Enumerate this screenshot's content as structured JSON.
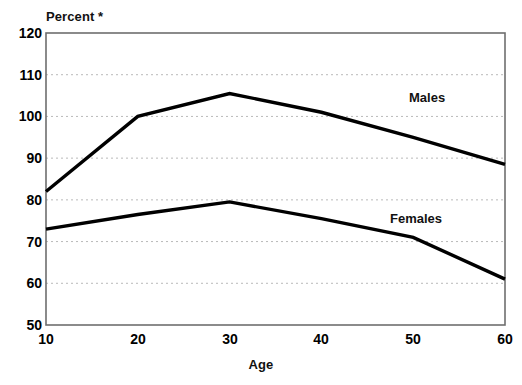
{
  "chart_data": {
    "type": "line",
    "title": "",
    "xlabel": "Age",
    "ylabel": "Percent *",
    "xlim": [
      10,
      60
    ],
    "ylim": [
      50,
      120
    ],
    "x": [
      10,
      20,
      30,
      40,
      50,
      60
    ],
    "xticks": [
      "10",
      "20",
      "30",
      "40",
      "50",
      "60"
    ],
    "yticks": [
      "120",
      "110",
      "100",
      "90",
      "80",
      "70",
      "60",
      "50"
    ],
    "grid": "horizontal-dotted",
    "legend_position": "inline-right",
    "series": [
      {
        "name": "Males",
        "values": [
          82,
          100,
          105.5,
          101,
          95,
          88.5
        ],
        "color": "#000000"
      },
      {
        "name": "Females",
        "values": [
          73,
          76.5,
          79.5,
          75.5,
          71,
          61
        ],
        "color": "#000000"
      }
    ]
  },
  "axes": {
    "y_title": "Percent *",
    "x_title": "Age"
  },
  "labels": {
    "males": "Males",
    "females": "Females"
  },
  "colors": {
    "line": "#000000",
    "grid": "#b9b9b9",
    "frame": "#6e6e6e",
    "background": "#ffffff"
  }
}
